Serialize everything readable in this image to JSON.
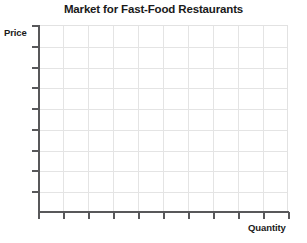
{
  "chart_data": {
    "type": "line",
    "title": "Market for Fast-Food Restaurants",
    "xlabel": "Quantity",
    "ylabel": "Price",
    "series": [],
    "x": [],
    "values": [],
    "categories": [],
    "xlim": [
      0,
      10
    ],
    "ylim": [
      0,
      9
    ],
    "x_tick_labels": [],
    "y_tick_labels": [],
    "x_tick_count": 11,
    "y_tick_count": 9,
    "grid": true,
    "grid_columns": 10,
    "grid_rows": 9,
    "legend": false,
    "legend_position": "none",
    "annotations": [],
    "note": "Empty labeled axes grid with no plotted data"
  },
  "figure": {
    "title": "Market for Fast-Food Restaurants",
    "y_axis_label": "Price",
    "x_axis_label": "Quantity",
    "colors": {
      "background": "#ffffff",
      "text": "#1a1a1a",
      "axis": "#58585a",
      "grid": "#e4e4e4"
    }
  }
}
